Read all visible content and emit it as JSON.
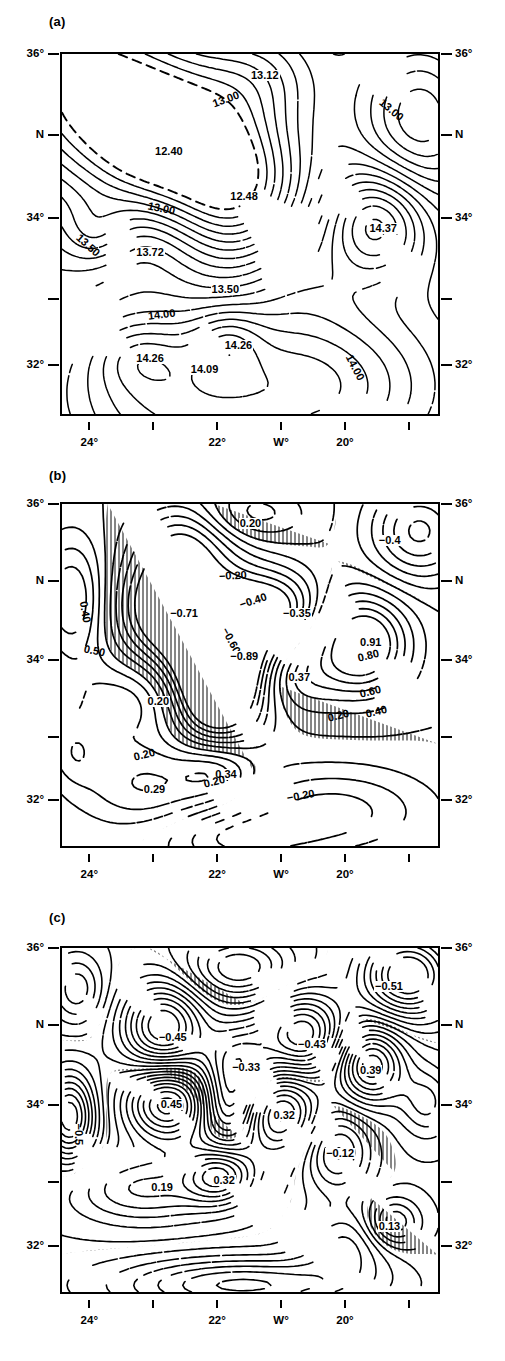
{
  "figure": {
    "type": "contour-map-series",
    "panels": [
      "a",
      "b",
      "c"
    ]
  },
  "axes": {
    "x_label_blank": "",
    "x_ticks": [
      {
        "pos": 0.07,
        "label": "24°"
      },
      {
        "pos": 0.24,
        "label": ""
      },
      {
        "pos": 0.41,
        "label": "22°"
      },
      {
        "pos": 0.58,
        "label": "W°"
      },
      {
        "pos": 0.75,
        "label": "20°"
      },
      {
        "pos": 0.92,
        "label": ""
      }
    ],
    "y_ticks": [
      {
        "pos": 0.0,
        "label": "36°"
      },
      {
        "pos": 0.225,
        "label": "N"
      },
      {
        "pos": 0.455,
        "label": "34°"
      },
      {
        "pos": 0.68,
        "label": ""
      },
      {
        "pos": 0.865,
        "label": "32°"
      }
    ],
    "x_range_deg_w": [
      25.0,
      18.8
    ],
    "y_range_deg_n": [
      31.2,
      36.0
    ]
  },
  "chart_data": [
    {
      "type": "contour",
      "panel": "(a)",
      "title": "",
      "variable": "temperature",
      "units": "°C",
      "contour_interval": 0.25,
      "contour_levels": [
        12.4,
        12.48,
        13.0,
        13.12,
        13.5,
        13.72,
        14.0,
        14.09,
        14.26,
        14.37
      ],
      "dashed_levels": [
        12.4,
        13.0,
        13.5
      ],
      "hatching": false,
      "xlabel": "W°",
      "ylabel": "N",
      "xlim": [
        25.0,
        18.8
      ],
      "ylim": [
        31.2,
        36.0
      ],
      "grid": false,
      "labels": [
        {
          "text": "13.12",
          "x": 0.5,
          "y": 0.045,
          "rot": 0
        },
        {
          "text": "13.00",
          "x": 0.4,
          "y": 0.125,
          "rot": -20
        },
        {
          "text": "13.00",
          "x": 0.845,
          "y": 0.115,
          "rot": 40
        },
        {
          "text": "12.40",
          "x": 0.245,
          "y": 0.255,
          "rot": 0
        },
        {
          "text": "12.48",
          "x": 0.445,
          "y": 0.38,
          "rot": 0
        },
        {
          "text": "13.00",
          "x": 0.225,
          "y": 0.405,
          "rot": 12
        },
        {
          "text": "13.50",
          "x": 0.04,
          "y": 0.49,
          "rot": 42
        },
        {
          "text": "13.72",
          "x": 0.195,
          "y": 0.535,
          "rot": 0
        },
        {
          "text": "14.37",
          "x": 0.815,
          "y": 0.47,
          "rot": 0
        },
        {
          "text": "13.50",
          "x": 0.395,
          "y": 0.64,
          "rot": 0
        },
        {
          "text": "14.00",
          "x": 0.225,
          "y": 0.715,
          "rot": -7
        },
        {
          "text": "14.26",
          "x": 0.43,
          "y": 0.795,
          "rot": 0
        },
        {
          "text": "14.26",
          "x": 0.195,
          "y": 0.83,
          "rot": 0
        },
        {
          "text": "14.09",
          "x": 0.34,
          "y": 0.862,
          "rot": 0
        },
        {
          "text": "14.00",
          "x": 0.76,
          "y": 0.82,
          "rot": 62
        }
      ]
    },
    {
      "type": "contour",
      "panel": "(b)",
      "title": "",
      "variable": "anomaly",
      "units": "",
      "contour_interval": 0.2,
      "contour_levels": [
        -0.89,
        -0.71,
        -0.6,
        -0.4,
        -0.35,
        -0.2,
        0.2,
        0.29,
        0.34,
        0.37,
        0.4,
        0.5,
        0.6,
        0.8,
        0.91
      ],
      "hatching": true,
      "hatch_meaning": "negative values",
      "xlabel": "W°",
      "ylabel": "N",
      "xlim": [
        25.0,
        18.8
      ],
      "ylim": [
        31.2,
        36.0
      ],
      "grid": false,
      "labels": [
        {
          "text": "0.20",
          "x": 0.47,
          "y": 0.04,
          "rot": 0
        },
        {
          "text": "−0.4",
          "x": 0.84,
          "y": 0.09,
          "rot": 0
        },
        {
          "text": "−0.20",
          "x": 0.415,
          "y": 0.195,
          "rot": -3
        },
        {
          "text": "0.40",
          "x": 0.055,
          "y": 0.265,
          "rot": 80
        },
        {
          "text": "−0.40",
          "x": 0.47,
          "y": 0.28,
          "rot": -18
        },
        {
          "text": "−0.71",
          "x": 0.285,
          "y": 0.305,
          "rot": 0
        },
        {
          "text": "−0.35",
          "x": 0.585,
          "y": 0.305,
          "rot": 0
        },
        {
          "text": "−0.60",
          "x": 0.43,
          "y": 0.345,
          "rot": 62
        },
        {
          "text": "0.50",
          "x": 0.055,
          "y": 0.405,
          "rot": 12
        },
        {
          "text": "0.91",
          "x": 0.79,
          "y": 0.39,
          "rot": 0
        },
        {
          "text": "−0.89",
          "x": 0.445,
          "y": 0.43,
          "rot": 0
        },
        {
          "text": "0.80",
          "x": 0.785,
          "y": 0.435,
          "rot": -14
        },
        {
          "text": "0.37",
          "x": 0.6,
          "y": 0.49,
          "rot": 0
        },
        {
          "text": "0.60",
          "x": 0.79,
          "y": 0.54,
          "rot": -14
        },
        {
          "text": "0.20",
          "x": 0.225,
          "y": 0.56,
          "rot": 0
        },
        {
          "text": "0.40",
          "x": 0.805,
          "y": 0.6,
          "rot": -14
        },
        {
          "text": "0.20",
          "x": 0.705,
          "y": 0.61,
          "rot": -14
        },
        {
          "text": "0.20",
          "x": 0.19,
          "y": 0.725,
          "rot": -14
        },
        {
          "text": "0.34",
          "x": 0.405,
          "y": 0.775,
          "rot": 0
        },
        {
          "text": "0.20",
          "x": 0.375,
          "y": 0.805,
          "rot": -14
        },
        {
          "text": "0.29",
          "x": 0.215,
          "y": 0.82,
          "rot": 0
        },
        {
          "text": "−0.20",
          "x": 0.595,
          "y": 0.845,
          "rot": -10
        }
      ]
    },
    {
      "type": "contour",
      "panel": "(c)",
      "title": "",
      "variable": "anomaly",
      "units": "",
      "contour_interval": 0.1,
      "contour_levels": [
        -0.51,
        -0.45,
        -0.43,
        -0.33,
        -0.12,
        0.13,
        0.19,
        0.32,
        0.39,
        0.45
      ],
      "hatching": true,
      "hatch_meaning": "negative values",
      "xlabel": "W°",
      "ylabel": "N",
      "xlim": [
        25.0,
        18.8
      ],
      "ylim": [
        31.2,
        36.0
      ],
      "grid": false,
      "labels": [
        {
          "text": "−0.51",
          "x": 0.83,
          "y": 0.095,
          "rot": 0
        },
        {
          "text": "−0.45",
          "x": 0.255,
          "y": 0.245,
          "rot": 0
        },
        {
          "text": "−0.43",
          "x": 0.625,
          "y": 0.265,
          "rot": 0
        },
        {
          "text": "0.39",
          "x": 0.79,
          "y": 0.34,
          "rot": 0
        },
        {
          "text": "−0.33",
          "x": 0.45,
          "y": 0.33,
          "rot": 0
        },
        {
          "text": "0.45",
          "x": 0.26,
          "y": 0.44,
          "rot": 0
        },
        {
          "text": "0.32",
          "x": 0.56,
          "y": 0.47,
          "rot": 0
        },
        {
          "text": "−0.5",
          "x": 0.042,
          "y": 0.49,
          "rot": 90
        },
        {
          "text": "−0.12",
          "x": 0.7,
          "y": 0.58,
          "rot": 0
        },
        {
          "text": "0.32",
          "x": 0.4,
          "y": 0.66,
          "rot": 0
        },
        {
          "text": "0.19",
          "x": 0.235,
          "y": 0.68,
          "rot": 0
        },
        {
          "text": "0.13",
          "x": 0.84,
          "y": 0.795,
          "rot": 0
        }
      ]
    }
  ]
}
